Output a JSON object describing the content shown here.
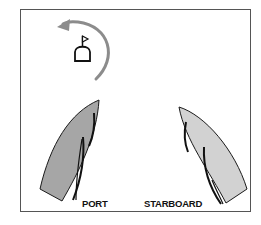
{
  "diagram": {
    "title": "",
    "labels": {
      "port": "PORT",
      "starboard": "STARBOARD"
    },
    "elements": [
      {
        "id": "mark",
        "type": "mark-buoy-with-flag"
      },
      {
        "id": "rounding-arrow",
        "type": "curved-arrow",
        "direction": "counter-clockwise"
      },
      {
        "id": "port-boat",
        "type": "boat",
        "tack": "port",
        "hull_color": "#a6a6a6"
      },
      {
        "id": "starboard-boat",
        "type": "boat",
        "tack": "starboard",
        "hull_color": "#d2d2d2"
      }
    ],
    "colors": {
      "frame": "#555555",
      "arrow": "#8c8c8c",
      "port_hull": "#a6a6a6",
      "starboard_hull": "#d2d2d2",
      "outline": "#1a1a1a"
    }
  }
}
